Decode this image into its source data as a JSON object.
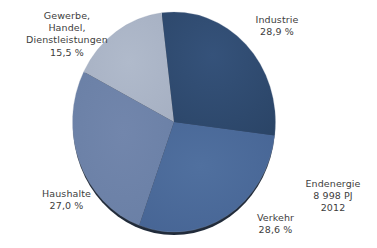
{
  "chart_data": {
    "type": "pie",
    "title": "",
    "subtitle": "",
    "xlabel": "",
    "ylabel": "",
    "legend_position": "none",
    "grid": false,
    "unit": "%",
    "total_label": "Endenergie",
    "total_value": "8 998 PJ",
    "year": "2012",
    "start_angle_deg": -7,
    "direction": "clockwise",
    "categories": [
      "Industrie",
      "Verkehr",
      "Haushalte",
      "Gewerbe, Handel, Dienstleistungen"
    ],
    "values": [
      28.9,
      28.6,
      27.0,
      15.5
    ],
    "value_labels": [
      "28,9 %",
      "28,6 %",
      "27,0 %",
      "15,5 %"
    ],
    "colors": [
      "#2e4a6e",
      "#4a6a9a",
      "#6d82a8",
      "#aab4c6"
    ],
    "slices": [
      {
        "name": "Industrie",
        "label": "Industrie",
        "value": 28.9,
        "value_label": "28,9 %",
        "color": "#2e4a6e"
      },
      {
        "name": "Verkehr",
        "label": "Verkehr",
        "value": 28.6,
        "value_label": "28,6 %",
        "color": "#4a6a9a"
      },
      {
        "name": "Haushalte",
        "label": "Haushalte",
        "value": 27.0,
        "value_label": "27,0 %",
        "color": "#6d82a8"
      },
      {
        "name": "Gewerbe, Handel, Dienstleistungen",
        "label_lines": [
          "Gewerbe,",
          "Handel,",
          "Dienstleistungen"
        ],
        "value": 15.5,
        "value_label": "15,5 %",
        "color": "#aab4c6"
      }
    ]
  },
  "labels": {
    "gewerbe": {
      "line1": "Gewerbe,",
      "line2": "Handel,",
      "line3": "Dienstleistungen",
      "pct": "15,5 %"
    },
    "industrie": {
      "name": "Industrie",
      "pct": "28,9 %"
    },
    "haushalte": {
      "name": "Haushalte",
      "pct": "27,0 %"
    },
    "verkehr": {
      "name": "Verkehr",
      "pct": "28,6 %"
    }
  },
  "annotation": {
    "line1": "Endenergie",
    "line2": "8 998 PJ",
    "line3": "2012"
  },
  "style": {
    "background": "#ffffff",
    "text_color": "#3d3d3d",
    "shadow_color": "#111a28"
  }
}
